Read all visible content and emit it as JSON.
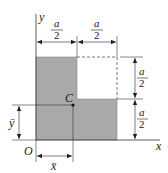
{
  "diagram": {
    "type": "L-shaped area centroid figure",
    "axes": {
      "x_label": "x",
      "y_label": "y",
      "origin_label": "O"
    },
    "centroid_label": "C",
    "centroid_coords": {
      "x_label": "x̄",
      "y_label": "ȳ"
    },
    "dimensions": {
      "top_left": {
        "numerator": "a",
        "denominator": "2"
      },
      "top_right": {
        "numerator": "a",
        "denominator": "2"
      },
      "right_upper": {
        "numerator": "a",
        "denominator": "2"
      },
      "right_lower": {
        "numerator": "a",
        "denominator": "2"
      }
    },
    "colors": {
      "fill": "#a9a9a9",
      "line": "#333333",
      "dashed": "#555555"
    }
  }
}
